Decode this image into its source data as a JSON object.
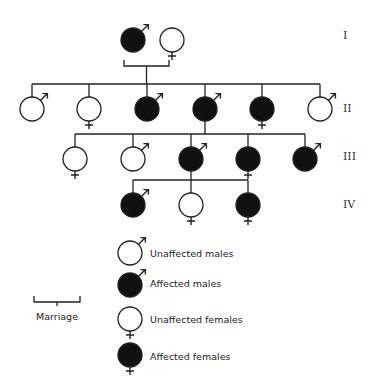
{
  "title": "",
  "generations": [
    {
      "label": "I",
      "members": [
        {
          "id": "I-1",
          "sex": "male",
          "affected": true
        },
        {
          "id": "I-2",
          "sex": "female",
          "affected": false
        }
      ]
    },
    {
      "label": "II",
      "members": [
        {
          "id": "II-1",
          "sex": "male",
          "affected": false
        },
        {
          "id": "II-2",
          "sex": "female",
          "affected": false
        },
        {
          "id": "II-3",
          "sex": "male",
          "affected": true
        },
        {
          "id": "II-4",
          "sex": "male",
          "affected": true
        },
        {
          "id": "II-5",
          "sex": "female",
          "affected": true
        },
        {
          "id": "II-6",
          "sex": "male",
          "affected": false
        }
      ]
    },
    {
      "label": "III",
      "members": [
        {
          "id": "III-1",
          "sex": "female",
          "affected": false
        },
        {
          "id": "III-2",
          "sex": "male",
          "affected": false
        },
        {
          "id": "III-3",
          "sex": "male",
          "affected": true
        },
        {
          "id": "III-4",
          "sex": "female",
          "affected": true
        },
        {
          "id": "III-5",
          "sex": "male",
          "affected": true
        }
      ]
    },
    {
      "label": "IV",
      "members": [
        {
          "id": "IV-1",
          "sex": "male",
          "affected": true
        },
        {
          "id": "IV-2",
          "sex": "female",
          "affected": false
        },
        {
          "id": "IV-3",
          "sex": "female",
          "affected": true
        }
      ]
    }
  ],
  "relationships": [
    {
      "type": "marriage",
      "partners": [
        "I-1",
        "I-2"
      ],
      "children": [
        "II-1",
        "II-2",
        "II-3",
        "II-4",
        "II-5",
        "II-6"
      ]
    },
    {
      "type": "descent",
      "parent": "II-4",
      "children": [
        "III-1",
        "III-2",
        "III-3",
        "III-4",
        "III-5"
      ]
    },
    {
      "type": "descent",
      "parent": "III-3",
      "children": [
        "IV-1",
        "IV-2",
        "IV-3"
      ]
    }
  ],
  "legend": {
    "items": [
      {
        "label": "Unaffected males",
        "sex": "male",
        "affected": false
      },
      {
        "label": "Affected males",
        "sex": "male",
        "affected": true
      },
      {
        "label": "Unaffected females",
        "sex": "female",
        "affected": false
      },
      {
        "label": "Affected females",
        "sex": "female",
        "affected": true
      }
    ],
    "marriage_label": "Marriage"
  },
  "colors": {
    "affected_fill": "#111111",
    "unaffected_fill": "#ffffff",
    "stroke": "#222222"
  }
}
